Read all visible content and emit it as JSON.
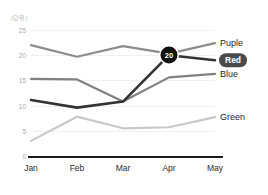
{
  "chart_data": {
    "type": "line",
    "title": "",
    "subtitle": "",
    "unit_label": "(단위)",
    "xlabel": "",
    "ylabel": "",
    "categories": [
      "Jan",
      "Feb",
      "Mar",
      "Apr",
      "May"
    ],
    "ylim": [
      0,
      25
    ],
    "yticks": [
      0,
      5,
      10,
      15,
      20,
      25
    ],
    "grid": true,
    "legend_position": "right",
    "series": [
      {
        "name": "Puple",
        "color": "#8c8c8c",
        "values": [
          22.0,
          19.7,
          21.8,
          20.3,
          22.4
        ]
      },
      {
        "name": "Red",
        "color": "#333333",
        "highlighted": true,
        "values": [
          11.1,
          9.6,
          10.8,
          20.0,
          19.0
        ]
      },
      {
        "name": "Blue",
        "color": "#808080",
        "values": [
          15.3,
          15.2,
          10.8,
          15.6,
          16.3
        ]
      },
      {
        "name": "Green",
        "color": "#c8c8c8",
        "values": [
          3.0,
          7.8,
          5.5,
          5.7,
          7.7
        ]
      }
    ],
    "annotations": [
      {
        "label": "20",
        "series": "Red",
        "category": "Apr",
        "value": 20
      }
    ]
  },
  "legend": {
    "items": [
      {
        "label": "Puple",
        "badge": false
      },
      {
        "label": "Red",
        "badge": true
      },
      {
        "label": "Blue",
        "badge": false
      },
      {
        "label": "Green",
        "badge": false
      }
    ]
  },
  "colors": {
    "baseline": "#1a1a1a",
    "gridline": "#f0f0f0",
    "ytick_text": "#a8a8a8",
    "xtick_text": "#2b2b2b",
    "marker_bg": "#111111",
    "badge_bg": "#4a4a4a"
  }
}
